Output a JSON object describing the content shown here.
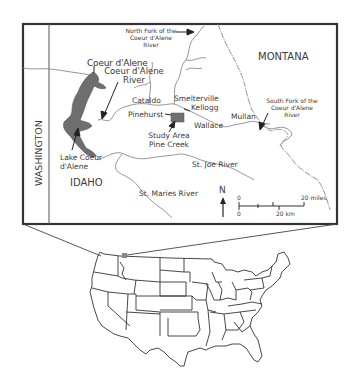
{
  "inset_map": {
    "states": {
      "washington": "WASHINGTON",
      "idaho": "IDAHO",
      "montana": "MONTANA"
    },
    "places": {
      "coeur_dalene_city": "Coeur d'Alene",
      "cataldo": "Cataldo",
      "smelterville": "Smelterville",
      "kellogg": "Kellogg",
      "pinehurst": "Pinehurst",
      "wallace": "Wallace",
      "mullan": "Mullan"
    },
    "features": {
      "coeur_dalene_river_line1": "Coeur d'Alene",
      "coeur_dalene_river_line2": "River",
      "north_fork_line1": "North Fork of the",
      "north_fork_line2": "Coeur d'Alene",
      "north_fork_line3": "River",
      "south_fork_line1": "South Fork of the",
      "south_fork_line2": "Coeur d'Alene",
      "south_fork_line3": "River",
      "lake_line1": "Lake Coeur",
      "lake_line2": "d'Alene",
      "study_area_line1": "Study Area",
      "study_area_line2": "Pine Creek",
      "st_joe_river": "St. Joe River",
      "st_maries_river": "St. Maries River"
    },
    "north_arrow": {
      "label": "N"
    },
    "scale_bar": {
      "miles_start": "0",
      "miles_end": "20 miles",
      "km_start": "0",
      "km_end": "20 km"
    },
    "colors": {
      "lake_fill": "#6e6e6e",
      "study_area_fill": "#707070",
      "frame": "#333333",
      "river": "#8a8a8a"
    }
  },
  "overview_map": {
    "description": "Contiguous United States outline with Idaho panhandle location highlighted"
  }
}
